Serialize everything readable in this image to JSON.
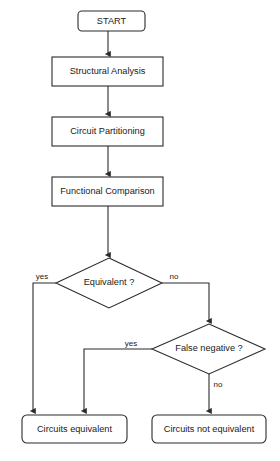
{
  "diagram": {
    "background_color": "#ffffff",
    "line_color": "#2b2b2b",
    "text_color": "#1a1a1a",
    "nodes": {
      "start": {
        "label": "START",
        "shape": "rounded-terminator"
      },
      "structural_analysis": {
        "label": "Structural Analysis",
        "shape": "process"
      },
      "circuit_partitioning": {
        "label": "Circuit Partitioning",
        "shape": "process"
      },
      "functional_comparison": {
        "label": "Functional Comparison",
        "shape": "process"
      },
      "equivalent_decision": {
        "label": "Equivalent ?",
        "shape": "decision"
      },
      "false_negative_decision": {
        "label": "False negative ?",
        "shape": "decision"
      },
      "circuits_equivalent": {
        "label": "Circuits equivalent",
        "shape": "rounded-terminator"
      },
      "circuits_not_equivalent": {
        "label": "Circuits not equivalent",
        "shape": "rounded-terminator"
      }
    },
    "edge_labels": {
      "equivalent_yes": "yes",
      "equivalent_no": "no",
      "false_negative_yes": "yes",
      "false_negative_no": "no"
    }
  }
}
